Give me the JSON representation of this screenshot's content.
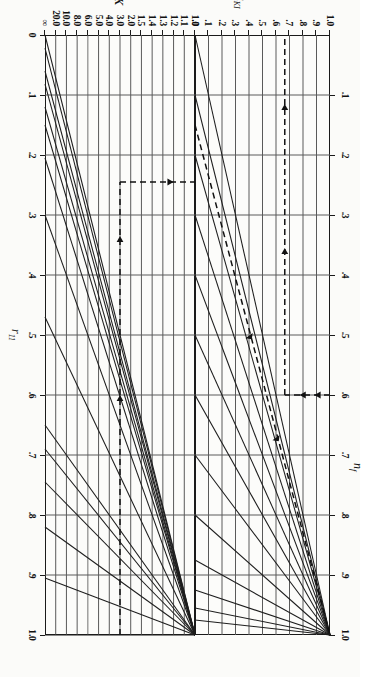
{
  "figure": {
    "orientation_deg": 90,
    "background": "#fbfbf9",
    "line_color": "#1d1d1d",
    "grid_color": "#4a4a4a"
  },
  "chart_data": [
    {
      "type": "line",
      "id": "upper-panel",
      "title": "",
      "xlabel": "n_f",
      "ylabel": "R_KI",
      "xlim": [
        0.0,
        1.0
      ],
      "ylim": [
        0.0,
        1.0
      ],
      "grid": true,
      "legend": "none",
      "xticks": [
        ".1",
        ".2",
        ".3",
        ".4",
        ".5",
        ".6",
        ".7",
        ".8",
        ".9",
        "1.0"
      ],
      "xtick_values": [
        0.1,
        0.2,
        0.3,
        0.4,
        0.5,
        0.6,
        0.7,
        0.8,
        0.9,
        1.0
      ],
      "yticks": [
        ".0",
        ".1",
        ".2",
        ".3",
        ".4",
        ".5",
        ".6",
        ".7",
        ".8",
        ".9",
        "1.0"
      ],
      "ytick_values": [
        0.0,
        0.1,
        0.2,
        0.3,
        0.4,
        0.5,
        0.6,
        0.7,
        0.8,
        0.9,
        1.0
      ],
      "description": "Fan of straight lines all passing through the point (n_f = 1.0, R_KI = 1.0); each line starts on the R_KI = 0 baseline at a different n_f intercept.",
      "series": [
        {
          "name": "line-1",
          "x": [
            0.0,
            1.0
          ],
          "y": [
            0.0,
            1.0
          ]
        },
        {
          "name": "line-2",
          "x": [
            0.1,
            1.0
          ],
          "y": [
            0.0,
            1.0
          ]
        },
        {
          "name": "line-3",
          "x": [
            0.2,
            1.0
          ],
          "y": [
            0.0,
            1.0
          ]
        },
        {
          "name": "line-4",
          "x": [
            0.3,
            1.0
          ],
          "y": [
            0.0,
            1.0
          ]
        },
        {
          "name": "line-5",
          "x": [
            0.4,
            1.0
          ],
          "y": [
            0.0,
            1.0
          ]
        },
        {
          "name": "line-6",
          "x": [
            0.5,
            1.0
          ],
          "y": [
            0.0,
            1.0
          ]
        },
        {
          "name": "line-7",
          "x": [
            0.6,
            1.0
          ],
          "y": [
            0.0,
            1.0
          ]
        },
        {
          "name": "line-8",
          "x": [
            0.7,
            1.0
          ],
          "y": [
            0.0,
            1.0
          ]
        },
        {
          "name": "line-9",
          "x": [
            0.8,
            1.0
          ],
          "y": [
            0.0,
            1.0
          ]
        },
        {
          "name": "line-10",
          "x": [
            0.875,
            1.0
          ],
          "y": [
            0.0,
            1.0
          ]
        },
        {
          "name": "line-11",
          "x": [
            0.925,
            1.0
          ],
          "y": [
            0.0,
            1.0
          ]
        },
        {
          "name": "line-12",
          "x": [
            0.955,
            1.0
          ],
          "y": [
            0.0,
            1.0
          ]
        },
        {
          "name": "line-13",
          "x": [
            0.975,
            1.0
          ],
          "y": [
            0.0,
            1.0
          ]
        }
      ],
      "construction": {
        "dashed_ray": {
          "x": [
            0.15,
            1.0
          ],
          "y": [
            0.0,
            1.0
          ],
          "arrow": "up-right"
        },
        "dashed_drop": {
          "x": 0.6,
          "y_from": 1.0,
          "y_to": 0.665,
          "arrows": "down"
        },
        "dashed_read": {
          "y": 0.665,
          "x_from": 0.6,
          "x_to": 0.0,
          "arrows": "left"
        }
      }
    },
    {
      "type": "line",
      "id": "lower-panel",
      "title": "",
      "xlabel": "r_11",
      "ylabel": "K",
      "xlim": [
        0.0,
        1.0
      ],
      "ylim_labels_top_to_bottom": [
        "1.0",
        "1.1",
        "1.2",
        "1.3",
        "1.4",
        "1.5",
        "2.0",
        "3.0",
        "4.0",
        "5.0",
        "6.0",
        "8.0",
        "10.0",
        "20.0",
        "∞"
      ],
      "grid": true,
      "legend": "none",
      "xticks": [
        "0",
        ".1",
        ".2",
        ".3",
        ".4",
        ".5",
        ".6",
        ".7",
        ".8",
        ".9",
        "1.0"
      ],
      "xtick_values": [
        0.0,
        0.1,
        0.2,
        0.3,
        0.4,
        0.5,
        0.6,
        0.7,
        0.8,
        0.9,
        1.0
      ],
      "yticks": [
        "1.0",
        "1.1",
        "1.2",
        "1.3",
        "1.4",
        "1.5",
        "2.0",
        "3.0",
        "4.0",
        "5.0",
        "6.0",
        "8.0",
        "10.0",
        "20.0",
        "∞"
      ],
      "ytick_values": [
        1.0,
        1.1,
        1.2,
        1.3,
        1.4,
        1.5,
        2.0,
        3.0,
        4.0,
        5.0,
        6.0,
        8.0,
        10.0,
        20.0,
        0
      ],
      "description": "Fan of straight constant-K lines all radiating from the point (r_11 = 1.0, K = 1.0) at the upper right of the panel, sweeping down and to the left.",
      "series": [
        {
          "name": "K-1.0",
          "K": "1.0",
          "x_at_bottom": 1.0
        },
        {
          "name": "K-1.1",
          "K": "1.1",
          "x_at_bottom": 0.905
        },
        {
          "name": "K-1.2",
          "K": "1.2",
          "x_at_bottom": 0.82
        },
        {
          "name": "K-1.3",
          "K": "1.3",
          "x_at_bottom": 0.745
        },
        {
          "name": "K-1.4",
          "K": "1.4",
          "x_at_bottom": 0.69
        },
        {
          "name": "K-1.5",
          "K": "1.5",
          "x_at_bottom": 0.65
        },
        {
          "name": "K-2.0",
          "K": "2.0",
          "x_at_bottom": 0.47
        },
        {
          "name": "K-3.0",
          "K": "3.0",
          "x_at_bottom": 0.3
        },
        {
          "name": "K-4.0",
          "K": "4.0",
          "x_at_bottom": 0.205
        },
        {
          "name": "K-5.0",
          "K": "5.0",
          "x_at_bottom": 0.15
        },
        {
          "name": "K-6.0",
          "K": "6.0",
          "x_at_bottom": 0.12
        },
        {
          "name": "K-8.0",
          "K": "8.0",
          "x_at_bottom": 0.082
        },
        {
          "name": "K-10.0",
          "K": "10.0",
          "x_at_bottom": 0.06
        },
        {
          "name": "K-20.0",
          "K": "20.0",
          "x_at_bottom": 0.022
        },
        {
          "name": "K-inf",
          "K": "∞",
          "x_at_bottom": 0.0
        }
      ],
      "construction": {
        "dashed_read": {
          "y_label": "0.7",
          "x_from": 1.0,
          "x_to": 0.245,
          "arrows": "left"
        },
        "dashed_rise": {
          "x": 0.245,
          "y_from": "0.7-row",
          "y_to": "top",
          "arrow": "up"
        }
      }
    }
  ],
  "labels": {
    "upper": {
      "y_axis_name": "R",
      "y_axis_sub": "KI",
      "x_axis_name": "n",
      "x_axis_sub": "f",
      "x_ticks": [
        ".1",
        ".2",
        ".3",
        ".4",
        ".5",
        ".6",
        ".7",
        ".8",
        ".9",
        "1.0"
      ],
      "y_ticks": [
        "1.0",
        ".9",
        ".8",
        ".7",
        ".6",
        ".5",
        ".4",
        ".3",
        ".2",
        ".1",
        ".0"
      ]
    },
    "lower": {
      "y_axis_name": "K",
      "x_axis_name": "r",
      "x_axis_sub": "11",
      "x_ticks": [
        "0",
        ".1",
        ".2",
        ".3",
        ".4",
        ".5",
        ".6",
        ".7",
        ".8",
        ".9",
        "1.0"
      ],
      "y_ticks": [
        "1.0",
        "1.1",
        "1.2",
        "1.3",
        "1.4",
        "1.5",
        "2.0",
        "3.0",
        "4.0",
        "5.0",
        "6.0",
        "8.0",
        "10.0",
        "20.0",
        "∞"
      ]
    }
  }
}
